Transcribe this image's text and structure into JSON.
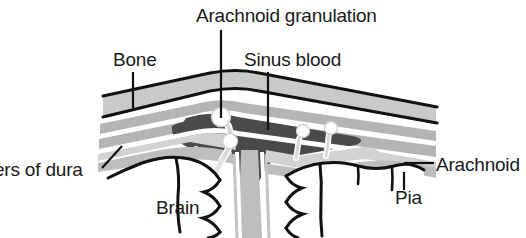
{
  "figure": {
    "title": "Arachnoid granulation",
    "width": 526,
    "height": 238,
    "background_color": "#ffffff"
  },
  "labels": {
    "granulation": "Arachnoid granulation",
    "bone": "Bone",
    "sinus_blood": "Sinus blood",
    "layers_of_dura": "ers of dura",
    "arachnoid": "Arachnoid",
    "pia": "Pia",
    "brain": "Brain"
  },
  "colors": {
    "outline": "#111111",
    "bone_fill": "#c9c9c9",
    "dura_fill": "#b4b4b4",
    "sinus_blood_fill": "#4a4a4a",
    "arachnoid_fill": "#d2d2d2",
    "pia_fill": "#bdbdbd",
    "brain_fill": "#ffffff",
    "text": "#1a1a1a",
    "leader_line": "#111111"
  },
  "structures": [
    {
      "name": "bone",
      "description": "outer skull band, light gray"
    },
    {
      "name": "dura-outer-layer",
      "description": "periosteal dura beneath bone"
    },
    {
      "name": "dura-inner-layer",
      "description": "meningeal dura lining sinus"
    },
    {
      "name": "superior-sagittal-sinus",
      "description": "dark triangular blood space"
    },
    {
      "name": "arachnoid-granulation-large",
      "description": "mushroom villus projecting into sinus"
    },
    {
      "name": "arachnoid-granulation-small-1",
      "description": "small villus right of center"
    },
    {
      "name": "arachnoid-granulation-small-2",
      "description": "second small villus right of center"
    },
    {
      "name": "arachnoid-membrane",
      "description": "thin gray layer over brain"
    },
    {
      "name": "pia-mater",
      "description": "thin layer hugging brain surface"
    },
    {
      "name": "falx-cerebri",
      "description": "midline dural fold descending between hemispheres"
    },
    {
      "name": "brain-left-hemisphere",
      "description": "gyri and sulci outlines"
    },
    {
      "name": "brain-right-hemisphere",
      "description": "gyri and sulci outlines"
    }
  ]
}
